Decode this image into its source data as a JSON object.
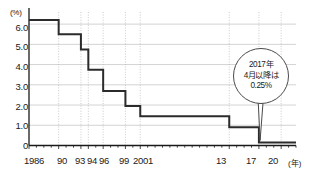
{
  "chart_data": {
    "type": "line",
    "title": "",
    "xlabel": "(年)",
    "ylabel": "(%)",
    "ylim": [
      0,
      6.6
    ],
    "xlim": [
      1986,
      2022
    ],
    "grid": true,
    "legend": false,
    "y_ticks": [
      "0",
      "1.0",
      "2.0",
      "3.0",
      "4.0",
      "5.0",
      "6.0"
    ],
    "y_tick_values": [
      0,
      1.0,
      2.0,
      3.0,
      4.0,
      5.0,
      6.0
    ],
    "x_ticks": [
      "1986",
      "90",
      "93",
      "94",
      "96",
      "99",
      "2001",
      "13",
      "17",
      "20"
    ],
    "x_tick_values": [
      1986,
      1990,
      1993,
      1994,
      1996,
      1999,
      2001,
      2013,
      2017,
      2020
    ],
    "step_points": [
      {
        "year": 1986,
        "value": 6.2
      },
      {
        "year": 1990,
        "value": 5.5
      },
      {
        "year": 1993,
        "value": 4.75
      },
      {
        "year": 1994,
        "value": 3.75
      },
      {
        "year": 1996,
        "value": 2.7
      },
      {
        "year": 1999,
        "value": 1.95
      },
      {
        "year": 2001,
        "value": 1.45
      },
      {
        "year": 2013,
        "value": 0.9
      },
      {
        "year": 2017,
        "value": 0.15
      },
      {
        "year": 2022,
        "value": 0.15
      }
    ],
    "annotations": [
      {
        "name": "callout-2017",
        "lines": [
          "2017年",
          "4月以降は",
          "0.25%"
        ],
        "target_year": 2017,
        "target_value": 0.15
      }
    ],
    "colors": {
      "line": "#2b2b2b",
      "grid": "#c8c8c8",
      "axis": "#1a1a1a",
      "guide": "#b5b5b5",
      "text": "#1a1a1a",
      "callout_border": "#4a4a4a",
      "background": "#ffffff"
    }
  }
}
